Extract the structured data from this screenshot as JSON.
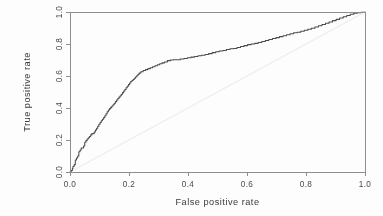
{
  "figure": {
    "name": "roc-curve-plot",
    "background_color": "#fdfdfd",
    "plot_box": {
      "left": 70,
      "top": 12,
      "right": 365,
      "bottom": 172
    },
    "box_border_color": "#8e8e8e",
    "curve_color": "#4c4c4c",
    "chance_line_color": "#ececec",
    "tick_label_rotation_deg": -90
  },
  "chart_data": {
    "type": "line",
    "title": "",
    "xlabel": "False positive rate",
    "ylabel": "True positive rate",
    "xlim": [
      0.0,
      1.0
    ],
    "ylim": [
      0.0,
      1.0
    ],
    "grid": false,
    "legend": "none",
    "xticks": [
      "0.0",
      "0.2",
      "0.4",
      "0.6",
      "0.8",
      "1.0"
    ],
    "xtick_values": [
      0.0,
      0.2,
      0.4,
      0.6,
      0.8,
      1.0
    ],
    "yticks": [
      "0.0",
      "0.2",
      "0.4",
      "0.6",
      "0.8",
      "1.0"
    ],
    "ytick_values": [
      0.0,
      0.2,
      0.4,
      0.6,
      0.8,
      1.0
    ],
    "annotations": [],
    "series": [
      {
        "name": "ROC curve",
        "style": "step",
        "color": "#4c4c4c",
        "x": [
          0.0,
          0.004,
          0.008,
          0.01,
          0.014,
          0.018,
          0.018,
          0.022,
          0.026,
          0.03,
          0.03,
          0.034,
          0.038,
          0.042,
          0.046,
          0.05,
          0.05,
          0.054,
          0.058,
          0.062,
          0.066,
          0.07,
          0.074,
          0.078,
          0.082,
          0.086,
          0.09,
          0.094,
          0.098,
          0.102,
          0.106,
          0.11,
          0.114,
          0.118,
          0.122,
          0.126,
          0.13,
          0.134,
          0.138,
          0.142,
          0.146,
          0.15,
          0.154,
          0.158,
          0.162,
          0.166,
          0.17,
          0.174,
          0.178,
          0.182,
          0.186,
          0.19,
          0.194,
          0.198,
          0.202,
          0.206,
          0.21,
          0.214,
          0.218,
          0.222,
          0.226,
          0.23,
          0.234,
          0.24,
          0.248,
          0.256,
          0.264,
          0.272,
          0.28,
          0.288,
          0.296,
          0.304,
          0.312,
          0.32,
          0.33,
          0.34,
          0.35,
          0.362,
          0.374,
          0.386,
          0.398,
          0.41,
          0.422,
          0.434,
          0.446,
          0.458,
          0.47,
          0.482,
          0.494,
          0.506,
          0.518,
          0.53,
          0.542,
          0.554,
          0.566,
          0.578,
          0.59,
          0.602,
          0.614,
          0.626,
          0.638,
          0.65,
          0.662,
          0.674,
          0.686,
          0.698,
          0.71,
          0.722,
          0.734,
          0.746,
          0.758,
          0.77,
          0.782,
          0.794,
          0.806,
          0.818,
          0.83,
          0.842,
          0.854,
          0.866,
          0.878,
          0.89,
          0.902,
          0.914,
          0.926,
          0.938,
          0.95,
          0.962,
          0.974,
          0.986,
          1.0
        ],
        "y": [
          0.0,
          0.01,
          0.022,
          0.034,
          0.046,
          0.06,
          0.075,
          0.088,
          0.1,
          0.112,
          0.126,
          0.138,
          0.15,
          0.15,
          0.162,
          0.174,
          0.186,
          0.196,
          0.206,
          0.214,
          0.222,
          0.232,
          0.24,
          0.24,
          0.25,
          0.262,
          0.274,
          0.286,
          0.298,
          0.31,
          0.32,
          0.33,
          0.34,
          0.352,
          0.364,
          0.376,
          0.388,
          0.396,
          0.404,
          0.412,
          0.42,
          0.43,
          0.44,
          0.45,
          0.46,
          0.468,
          0.476,
          0.486,
          0.496,
          0.506,
          0.516,
          0.526,
          0.536,
          0.546,
          0.556,
          0.566,
          0.572,
          0.578,
          0.586,
          0.594,
          0.602,
          0.61,
          0.618,
          0.626,
          0.634,
          0.64,
          0.646,
          0.652,
          0.658,
          0.664,
          0.67,
          0.676,
          0.682,
          0.688,
          0.696,
          0.7,
          0.702,
          0.702,
          0.706,
          0.71,
          0.714,
          0.718,
          0.722,
          0.726,
          0.73,
          0.734,
          0.74,
          0.746,
          0.752,
          0.756,
          0.76,
          0.766,
          0.77,
          0.772,
          0.778,
          0.784,
          0.79,
          0.796,
          0.8,
          0.804,
          0.81,
          0.816,
          0.822,
          0.828,
          0.834,
          0.84,
          0.846,
          0.852,
          0.858,
          0.864,
          0.87,
          0.874,
          0.88,
          0.886,
          0.892,
          0.898,
          0.906,
          0.914,
          0.922,
          0.93,
          0.938,
          0.946,
          0.954,
          0.962,
          0.97,
          0.978,
          0.986,
          0.992,
          0.996,
          0.998,
          1.0
        ]
      },
      {
        "name": "Chance line",
        "style": "line",
        "color": "#ececec",
        "x": [
          0.0,
          1.0
        ],
        "y": [
          0.0,
          1.0
        ]
      }
    ]
  }
}
